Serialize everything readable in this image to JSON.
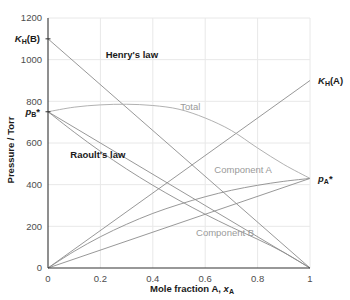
{
  "chart_data": {
    "type": "line",
    "title": "",
    "xlabel": "Mole fraction A, x",
    "xlabel_sub": "A",
    "ylabel": "Pressure / Torr",
    "xlim": [
      0,
      1
    ],
    "ylim": [
      0,
      1200
    ],
    "grid": true,
    "xticks": [
      "0",
      "0.2",
      "0.4",
      "0.6",
      "0.8",
      "1"
    ],
    "xtick_values": [
      0,
      0.2,
      0.4,
      0.6,
      0.8,
      1
    ],
    "yticks": [
      "0",
      "200",
      "400",
      "600",
      "800",
      "1000",
      "1200"
    ],
    "ytick_values": [
      0,
      200,
      400,
      600,
      800,
      1000,
      1200
    ],
    "constants": {
      "KH_B": 1100,
      "KH_A": 900,
      "pB_star": 750,
      "pA_star": 430
    },
    "series": [
      {
        "name": "Henry's law (B)",
        "kind": "straight",
        "x": [
          0,
          1
        ],
        "values": [
          1100,
          0
        ],
        "color": "#8c8c8c"
      },
      {
        "name": "Henry's law (A)",
        "kind": "straight",
        "x": [
          0,
          1
        ],
        "values": [
          0,
          900
        ],
        "color": "#8c8c8c"
      },
      {
        "name": "Raoult's law (B)",
        "kind": "straight",
        "x": [
          0,
          1
        ],
        "values": [
          750,
          0
        ],
        "color": "#8c8c8c"
      },
      {
        "name": "Raoult's law (A)",
        "kind": "straight",
        "x": [
          0,
          1
        ],
        "values": [
          0,
          430
        ],
        "color": "#8c8c8c"
      },
      {
        "name": "Component B",
        "kind": "curve",
        "x": [
          0,
          0.1,
          0.2,
          0.3,
          0.4,
          0.5,
          0.6,
          0.7,
          0.8,
          0.9,
          1
        ],
        "values": [
          750,
          652,
          560,
          475,
          397,
          325,
          258,
          196,
          138,
          75,
          0
        ],
        "color": "#8c8c8c"
      },
      {
        "name": "Component A",
        "kind": "curve",
        "x": [
          0,
          0.1,
          0.2,
          0.3,
          0.4,
          0.5,
          0.6,
          0.7,
          0.8,
          0.9,
          1
        ],
        "values": [
          0,
          80,
          150,
          210,
          262,
          305,
          342,
          373,
          397,
          416,
          430
        ],
        "color": "#8c8c8c"
      },
      {
        "name": "Total",
        "kind": "curve",
        "x": [
          0,
          0.1,
          0.2,
          0.3,
          0.4,
          0.5,
          0.6,
          0.7,
          0.8,
          0.9,
          1
        ],
        "values": [
          750,
          772,
          783,
          786,
          780,
          762,
          720,
          660,
          576,
          497,
          430
        ],
        "color": "#a8a8a8"
      }
    ],
    "annotations": [
      {
        "id": "henrys-law",
        "text": "Henry's law",
        "x": 0.22,
        "y": 1010,
        "style": "dark"
      },
      {
        "id": "raoults-law",
        "text": "Raoult's law",
        "x": 0.085,
        "y": 530,
        "style": "dark"
      },
      {
        "id": "total",
        "text": "Total",
        "x": 0.505,
        "y": 760,
        "style": "gray"
      },
      {
        "id": "component-a",
        "text": "Component A",
        "x": 0.635,
        "y": 455,
        "style": "gray"
      },
      {
        "id": "component-b",
        "text": "Component B",
        "x": 0.565,
        "y": 155,
        "style": "gray"
      }
    ],
    "axis_markers": [
      {
        "id": "kh-b",
        "label_main": "K",
        "label_sub": "H",
        "label_tail": "(B)",
        "y": 1100,
        "side": "left"
      },
      {
        "id": "pb-star",
        "label_main": "p",
        "label_sub": "B",
        "label_tail": "*",
        "y": 750,
        "side": "left"
      },
      {
        "id": "kh-a",
        "label_main": "K",
        "label_sub": "H",
        "label_tail": "(A)",
        "y": 900,
        "side": "right"
      },
      {
        "id": "pa-star",
        "label_main": "p",
        "label_sub": "A",
        "label_tail": "*",
        "y": 430,
        "side": "right"
      }
    ]
  }
}
